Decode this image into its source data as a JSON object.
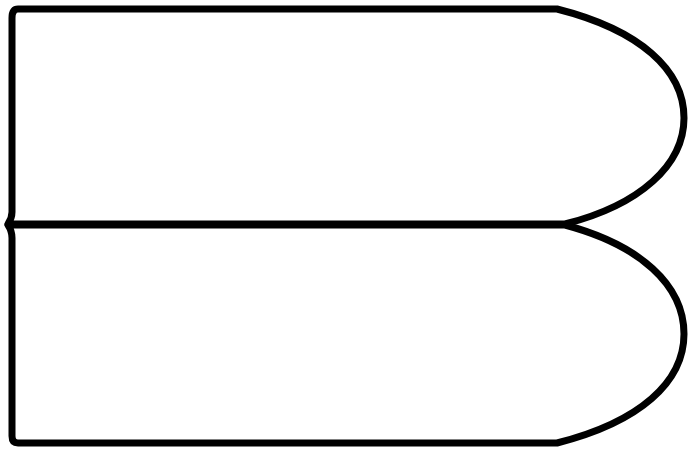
{
  "diagram": {
    "colors": {
      "stroke": "#000000",
      "fill": "#ffffff",
      "background": "#ffffff"
    },
    "shapes": [
      {
        "id": "top",
        "label": ""
      },
      {
        "id": "bottom",
        "label": ""
      }
    ]
  }
}
